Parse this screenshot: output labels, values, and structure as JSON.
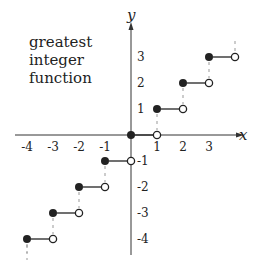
{
  "chart_data": {
    "type": "line",
    "title_lines": [
      "greatest",
      "integer",
      "function"
    ],
    "xlabel": "x",
    "ylabel": "y",
    "xlim": [
      -4.5,
      4.3
    ],
    "ylim": [
      -4.6,
      4.5
    ],
    "x_ticks": [
      -4,
      -3,
      -2,
      -1,
      1,
      2,
      3
    ],
    "y_ticks": [
      3,
      2,
      1,
      -1,
      -2,
      -3,
      -4
    ],
    "grid": false,
    "legend": null,
    "segments": [
      {
        "x_start": -4,
        "x_end": -3,
        "y": -4,
        "start": "closed",
        "end": "open"
      },
      {
        "x_start": -3,
        "x_end": -2,
        "y": -3,
        "start": "closed",
        "end": "open"
      },
      {
        "x_start": -2,
        "x_end": -1,
        "y": -2,
        "start": "closed",
        "end": "open"
      },
      {
        "x_start": -1,
        "x_end": 0,
        "y": -1,
        "start": "closed",
        "end": "open"
      },
      {
        "x_start": 0,
        "x_end": 1,
        "y": 0,
        "start": "closed",
        "end": "open"
      },
      {
        "x_start": 1,
        "x_end": 2,
        "y": 1,
        "start": "closed",
        "end": "open"
      },
      {
        "x_start": 2,
        "x_end": 3,
        "y": 2,
        "start": "closed",
        "end": "open"
      },
      {
        "x_start": 3,
        "x_end": 4,
        "y": 3,
        "start": "closed",
        "end": "open"
      }
    ],
    "colors": {
      "line": "#222222",
      "dash": "#999999",
      "axis": "#333333"
    }
  }
}
